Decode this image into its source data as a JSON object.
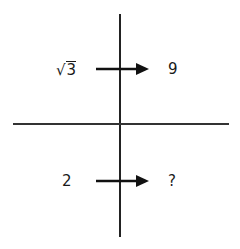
{
  "diagram": {
    "top_row": {
      "input": "3",
      "input_prefix": "√",
      "output": "9"
    },
    "bottom_row": {
      "input": "2",
      "output": "?"
    },
    "colors": {
      "line": "#222222",
      "arrow": "#111111",
      "text": "#1a1a1a"
    }
  }
}
